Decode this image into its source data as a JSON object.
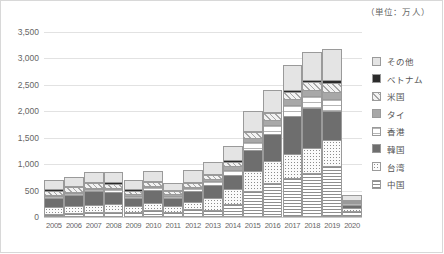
{
  "unit_note": "（単位：万人）",
  "legend": {
    "items": [
      {
        "label": "その他",
        "key": "other",
        "color": "#e4e4e4"
      },
      {
        "label": "ベトナム",
        "key": "vietnam",
        "color": "#2b2b2b"
      },
      {
        "label": "米国",
        "key": "usa",
        "color": "#f2f2f2"
      },
      {
        "label": "タイ",
        "key": "thailand",
        "color": "#a8a8a8"
      },
      {
        "label": "香港",
        "key": "hongkong",
        "color": "#ffffff"
      },
      {
        "label": "韓国",
        "key": "korea",
        "color": "#6e6e6e"
      },
      {
        "label": "台湾",
        "key": "taiwan",
        "color": "#fbfbfb"
      },
      {
        "label": "中国",
        "key": "china",
        "color": "#ffffff"
      }
    ]
  },
  "chart_data": {
    "type": "bar",
    "title": "",
    "subtitle": "",
    "xlabel": "",
    "ylabel": "",
    "unit": "万人",
    "stacked": true,
    "grid": true,
    "legend_position": "right",
    "ylim": [
      0,
      3500
    ],
    "yticks": [
      0,
      500,
      1000,
      1500,
      2000,
      2500,
      3000,
      3500
    ],
    "ytick_labels": [
      "0",
      "500",
      "1,000",
      "1,500",
      "2,000",
      "2,500",
      "3,000",
      "3,500"
    ],
    "categories": [
      "2005",
      "2006",
      "2007",
      "2008",
      "2009",
      "2010",
      "2011",
      "2012",
      "2013",
      "2014",
      "2015",
      "2016",
      "2017",
      "2018",
      "2019",
      "2020"
    ],
    "series": [
      {
        "name": "中国",
        "key": "china",
        "values": [
          65,
          81,
          94,
          100,
          101,
          141,
          104,
          143,
          131,
          241,
          499,
          637,
          736,
          838,
          959,
          107
        ]
      },
      {
        "name": "台湾",
        "key": "taiwan",
        "values": [
          127,
          130,
          139,
          139,
          102,
          127,
          99,
          147,
          221,
          283,
          368,
          417,
          456,
          476,
          489,
          69
        ]
      },
      {
        "name": "韓国",
        "key": "korea",
        "values": [
          175,
          212,
          260,
          238,
          159,
          244,
          166,
          204,
          246,
          276,
          400,
          509,
          714,
          754,
          558,
          49
        ]
      },
      {
        "name": "香港",
        "key": "hongkong",
        "values": [
          30,
          35,
          43,
          55,
          45,
          51,
          36,
          48,
          75,
          93,
          152,
          184,
          223,
          221,
          229,
          35
        ]
      },
      {
        "name": "タイ",
        "key": "thailand",
        "values": [
          12,
          12,
          17,
          19,
          18,
          21,
          14,
          26,
          45,
          66,
          80,
          90,
          99,
          113,
          132,
          22
        ]
      },
      {
        "name": "米国",
        "key": "usa",
        "values": [
          82,
          82,
          82,
          77,
          70,
          73,
          57,
          72,
          80,
          89,
          103,
          124,
          137,
          153,
          172,
          22
        ]
      },
      {
        "name": "ベトナム",
        "key": "vietnam",
        "values": [
          3,
          4,
          4,
          5,
          5,
          4,
          4,
          5,
          8,
          12,
          19,
          23,
          31,
          39,
          50,
          15
        ]
      },
      {
        "name": "その他",
        "key": "other",
        "values": [
          179,
          177,
          196,
          202,
          180,
          200,
          140,
          223,
          230,
          281,
          376,
          420,
          473,
          525,
          599,
          93
        ]
      }
    ],
    "totals": [
      673,
      733,
      835,
      835,
      679,
      861,
      622,
      836,
      1036,
      1341,
      1974,
      2404,
      2869,
      3119,
      3188,
      412
    ]
  }
}
